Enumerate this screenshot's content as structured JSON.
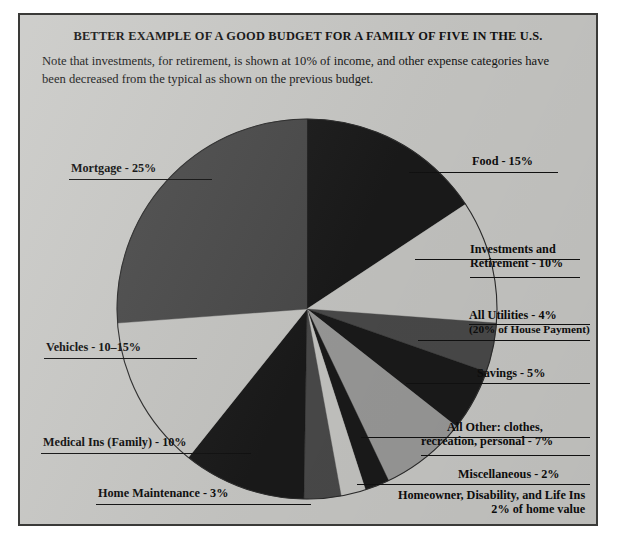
{
  "header": {
    "title": "BETTER EXAMPLE OF A GOOD BUDGET FOR A FAMILY OF FIVE IN THE U.S.",
    "subtitle": "Note that investments, for retirement, is shown at 10% of income, and other expense categories have been decreased from the typical as shown on the previous budget."
  },
  "colors": {
    "panel_background": "#c9c9c6",
    "border": "#3a3a38",
    "text": "#0d0d0d",
    "slice_dark": "#1a1a1a",
    "slice_mid_dark": "#4a4a4a",
    "slice_mid": "#6f6f6f",
    "slice_light": "#c6c6c3",
    "slice_mid_light": "#9a9a99"
  },
  "chart_data": {
    "type": "pie",
    "title": "BETTER EXAMPLE OF A GOOD BUDGET FOR A FAMILY OF FIVE IN THE U.S.",
    "xlabel": "",
    "ylabel": "",
    "legend_position": "callout-labels",
    "grid": false,
    "start_angle_deg": 0,
    "direction": "clockwise",
    "center": [
      305,
      307
    ],
    "radius": 190,
    "categories": [
      "Food",
      "Investments and Retirement",
      "All Utilities",
      "Savings",
      "All Other: clothes, recreation, personal",
      "Miscellaneous",
      "Homeowner, Disability, and Life Ins",
      "Home Maintenance",
      "Medical Ins (Family)",
      "Vehicles",
      "Mortgage"
    ],
    "values": [
      15,
      10,
      4,
      5,
      7,
      2,
      2,
      3,
      10,
      12.5,
      25
    ],
    "labels": [
      "Food - 15%",
      "Investments and Retirement - 10%",
      "All Utilities - 4% (20% of House Payment)",
      "Savings - 5%",
      "All Other: clothes, recreation, personal - 7%",
      "Miscellaneous - 2%",
      "Homeowner, Disability, and Life Ins 2% of home value",
      "Home Maintenance - 3%",
      "Medical Ins (Family) - 10%",
      "Vehicles - 10-15%",
      "Mortgage - 25%"
    ],
    "slice_colors": [
      "#1a1a1a",
      "#c6c6c3",
      "#4a4a4a",
      "#1a1a1a",
      "#9a9a99",
      "#1a1a1a",
      "#c6c6c3",
      "#4a4a4a",
      "#1a1a1a",
      "#c6c6c3",
      "#4a4a4a"
    ]
  },
  "callouts": {
    "food": {
      "text": "Food - 15%"
    },
    "investments": {
      "line1": "Investments and",
      "line2": "Retirement - 10%"
    },
    "utilities": {
      "line1": "All Utilities - 4%",
      "line2": "(20% of House Payment)"
    },
    "savings": {
      "text": "Savings - 5%"
    },
    "all_other": {
      "line1": "All Other: clothes,",
      "line2": "recreation, personal  - 7%"
    },
    "miscellaneous": {
      "text": "Miscellaneous  - 2%"
    },
    "insurance": {
      "line1": "Homeowner, Disability, and Life Ins",
      "line2": "2% of home value"
    },
    "home_maintenance": {
      "text": "Home Maintenance - 3%"
    },
    "medical": {
      "text": "Medical Ins (Family) - 10%"
    },
    "vehicles": {
      "text": "Vehicles - 10–15%"
    },
    "mortgage": {
      "text": "Mortgage - 25%"
    }
  }
}
